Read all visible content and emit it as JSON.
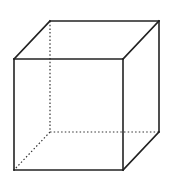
{
  "diagram": {
    "type": "wireframe-cube",
    "colors": {
      "background": "#ffffff",
      "edge": "#222222",
      "hidden_edge": "#333333"
    },
    "vertices": {
      "front_top_left": [
        14,
        59
      ],
      "front_top_right": [
        123,
        59
      ],
      "front_bottom_left": [
        14,
        170
      ],
      "front_bottom_right": [
        123,
        170
      ],
      "back_top_left": [
        50,
        21
      ],
      "back_top_right": [
        159,
        21
      ],
      "back_bottom_left": [
        50,
        132
      ],
      "back_bottom_right": [
        159,
        132
      ]
    },
    "solid_edges": [
      [
        "front_top_left",
        "front_top_right"
      ],
      [
        "front_top_right",
        "front_bottom_right"
      ],
      [
        "front_bottom_right",
        "front_bottom_left"
      ],
      [
        "front_bottom_left",
        "front_top_left"
      ],
      [
        "front_top_left",
        "back_top_left"
      ],
      [
        "back_top_left",
        "back_top_right"
      ],
      [
        "back_top_right",
        "front_top_right"
      ],
      [
        "back_top_right",
        "back_bottom_right"
      ],
      [
        "back_bottom_right",
        "front_bottom_right"
      ]
    ],
    "hidden_edges": [
      [
        "back_top_left",
        "back_bottom_left"
      ],
      [
        "back_bottom_left",
        "back_bottom_right"
      ],
      [
        "back_bottom_left",
        "front_bottom_left"
      ]
    ]
  }
}
